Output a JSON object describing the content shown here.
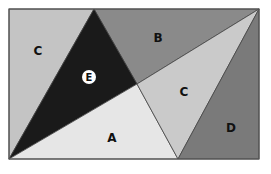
{
  "diagram": {
    "type": "rectangle-partition",
    "rect": {
      "x": 9,
      "y": 9,
      "w": 250,
      "h": 150
    },
    "regions": [
      {
        "id": "C-left",
        "label": "C",
        "color": "#c4c4c4",
        "points": "9,9 94,9 9,159",
        "label_pos": [
          38,
          51
        ]
      },
      {
        "id": "B",
        "label": "B",
        "color": "#8a8a8a",
        "points": "94,9 259,9 137,84",
        "label_pos": [
          158,
          38
        ]
      },
      {
        "id": "E",
        "label": "E",
        "color": "#1a1a1a",
        "points": "94,9 137,84 9,159",
        "label_pos": [
          89,
          77
        ],
        "label_style": "circle"
      },
      {
        "id": "A",
        "label": "A",
        "color": "#e6e6e6",
        "points": "9,159 137,84 178,159",
        "label_pos": [
          112,
          138
        ]
      },
      {
        "id": "C-right",
        "label": "C",
        "color": "#cacaca",
        "points": "137,84 259,9 178,159",
        "label_pos": [
          184,
          92
        ]
      },
      {
        "id": "D",
        "label": "D",
        "color": "#7a7a7a",
        "points": "259,9 259,159 178,159",
        "label_pos": [
          231,
          128
        ]
      }
    ],
    "stroke": "#444444"
  }
}
